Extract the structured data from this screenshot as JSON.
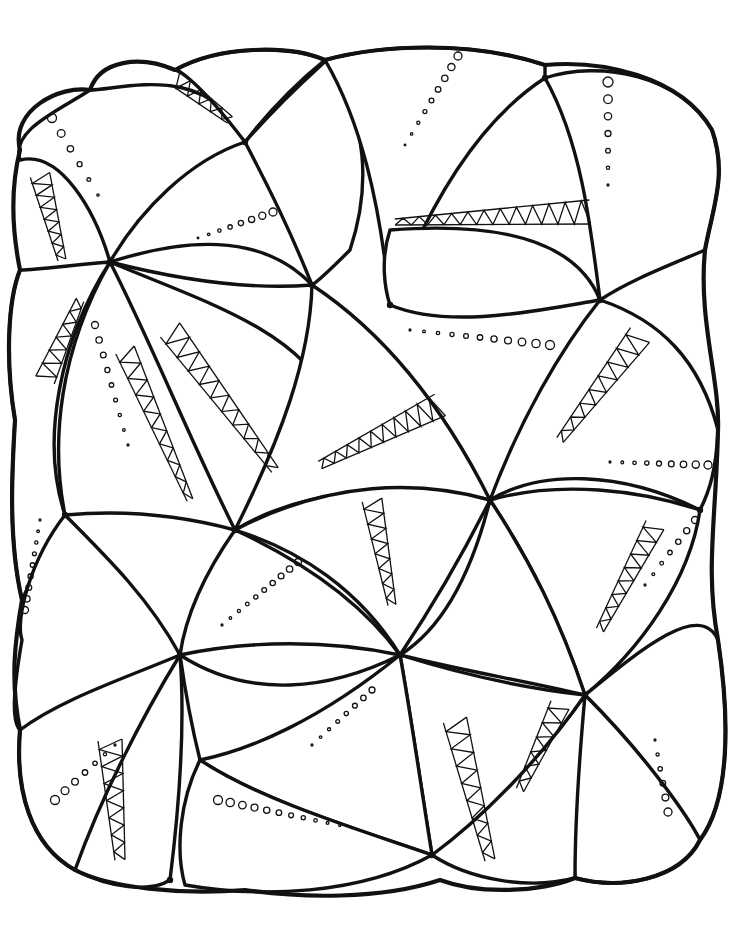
{
  "artwork": {
    "kind": "zentangle-coloring-page",
    "background": "#ffffff",
    "ink": "#111111",
    "outer_shape": "M 20 150 C 10 110 60 85 90 90 C 100 60 140 55 175 70 C 220 45 290 45 325 60 C 380 45 470 40 545 65 C 600 60 680 75 712 130 C 728 175 712 210 705 250 C 698 320 720 380 718 430 C 716 520 705 570 718 640 C 730 720 730 800 700 840 C 680 880 620 890 575 878 C 540 892 480 895 440 880 C 380 900 300 898 245 890 C 180 895 110 888 75 870 C 30 845 15 790 20 730 C 10 680 15 640 22 600 C 8 540 12 470 15 420 C 5 360 8 300 20 270 C 12 230 10 190 20 150 Z",
    "hubs": [
      {
        "x": 245,
        "y": 142
      },
      {
        "x": 110,
        "y": 262
      },
      {
        "x": 390,
        "y": 305
      },
      {
        "x": 545,
        "y": 78
      },
      {
        "x": 600,
        "y": 300
      },
      {
        "x": 312,
        "y": 285
      },
      {
        "x": 65,
        "y": 515
      },
      {
        "x": 235,
        "y": 530
      },
      {
        "x": 490,
        "y": 500
      },
      {
        "x": 180,
        "y": 655
      },
      {
        "x": 400,
        "y": 655
      },
      {
        "x": 585,
        "y": 695
      },
      {
        "x": 432,
        "y": 855
      },
      {
        "x": 170,
        "y": 880
      },
      {
        "x": 700,
        "y": 510
      }
    ],
    "petals": [
      {
        "d": "M 245 142 C 210 60 120 90 90 90 C 60 110 10 130 20 160 C 60 150 95 210 110 262 C 140 210 190 160 245 142 Z",
        "hub": 0,
        "rays": 16
      },
      {
        "d": "M 245 142 C 300 80 330 60 325 60 C 370 120 370 190 350 250 C 330 270 320 280 312 285 C 290 230 270 190 245 142 Z",
        "hub": 0,
        "rays": 14
      },
      {
        "d": "M 245 142 C 190 70 175 70 175 70 C 220 45 290 45 325 60 C 300 80 270 110 245 142 Z",
        "hub": 0,
        "rays": 12
      },
      {
        "d": "M 110 262 C 180 240 260 230 312 285 C 250 290 180 280 110 262 Z",
        "hub": 1,
        "rays": 12
      },
      {
        "d": "M 545 65 C 470 40 380 45 325 60 C 360 120 380 200 390 305 C 430 200 480 120 545 78 Z",
        "hub": 3,
        "rays": 18
      },
      {
        "d": "M 545 78 C 600 60 680 75 712 130 C 728 175 712 210 705 250 C 670 265 630 280 600 300 C 590 220 580 140 545 78 Z",
        "hub": 3,
        "rays": 14
      },
      {
        "d": "M 390 305 C 450 330 540 310 600 300 C 580 250 520 220 390 230 C 380 260 385 290 390 305 Z",
        "hub": 2,
        "rays": 14
      },
      {
        "d": "M 600 300 C 660 320 700 360 718 430 C 716 470 710 490 700 510 C 620 470 540 470 490 500 C 520 420 560 350 600 300 Z",
        "hub": 4,
        "rays": 18
      },
      {
        "d": "M 110 262 C 60 350 50 440 65 515 C 120 510 180 515 235 530 C 200 440 160 340 110 262 Z",
        "hub": 1,
        "rays": 18
      },
      {
        "d": "M 110 262 C 200 300 300 330 330 400 C 320 460 280 500 235 530 C 190 440 150 340 110 262 Z",
        "hub": 1,
        "rays": 16
      },
      {
        "d": "M 312 285 C 380 330 440 400 490 500 C 400 480 300 490 235 530 C 280 440 310 360 312 285 Z",
        "hub": 5,
        "rays": 18
      },
      {
        "d": "M 20 270 C 8 300 5 360 15 420 C 12 470 8 540 22 600 C 40 560 55 540 65 515 C 40 440 60 340 110 262 C 70 265 40 270 20 270 Z",
        "hub": 1,
        "rays": 12
      },
      {
        "d": "M 65 515 C 30 560 15 620 22 640 C 15 680 10 720 20 730 C 80 700 140 680 180 655 C 150 600 110 560 65 515 Z",
        "hub": 6,
        "rays": 16
      },
      {
        "d": "M 235 530 C 200 580 185 620 180 655 C 250 640 330 640 400 655 C 360 600 300 560 235 530 Z",
        "hub": 7,
        "rays": 16
      },
      {
        "d": "M 235 530 C 330 480 420 480 490 500 C 460 560 430 610 400 655 C 360 590 300 550 235 530 Z",
        "hub": 7,
        "rays": 18
      },
      {
        "d": "M 490 500 C 560 480 640 490 700 510 C 690 580 640 650 585 695 C 560 620 530 560 490 500 Z",
        "hub": 8,
        "rays": 18
      },
      {
        "d": "M 490 500 C 470 580 440 630 400 655 C 460 670 520 680 585 695 C 560 620 530 560 490 500 Z",
        "hub": 8,
        "rays": 14
      },
      {
        "d": "M 585 695 C 640 650 700 600 718 640 C 730 720 730 800 700 840 C 670 790 630 740 585 695 Z",
        "hub": 11,
        "rays": 16
      },
      {
        "d": "M 585 695 C 650 760 690 820 700 840 C 680 880 620 890 575 878 C 570 820 575 750 585 695 Z",
        "hub": 11,
        "rays": 14
      },
      {
        "d": "M 585 695 C 540 760 470 820 432 855 C 470 880 530 890 575 878 C 575 820 580 750 585 695 Z",
        "hub": 11,
        "rays": 14
      },
      {
        "d": "M 400 655 C 480 680 540 690 585 695 C 540 760 480 820 432 855 C 420 780 410 710 400 655 Z",
        "hub": 10,
        "rays": 16
      },
      {
        "d": "M 400 655 C 320 700 240 750 200 760 C 260 800 360 830 432 855 C 420 780 410 710 400 655 Z",
        "hub": 10,
        "rays": 16
      },
      {
        "d": "M 180 655 C 250 700 330 690 400 655 C 320 720 250 750 200 760 C 190 720 185 690 180 655 Z",
        "hub": 9,
        "rays": 12
      },
      {
        "d": "M 180 655 C 130 720 90 790 75 870 C 110 888 150 893 170 880 C 180 800 185 720 180 655 Z",
        "hub": 9,
        "rays": 12
      },
      {
        "d": "M 20 730 C 15 790 30 845 75 870 C 100 800 140 720 180 655 C 120 680 60 700 20 730 Z",
        "hub": 9,
        "rays": 14
      },
      {
        "d": "M 200 760 C 180 800 175 850 185 885 C 260 898 360 895 432 855 C 360 830 260 800 200 760 Z",
        "hub": 12,
        "rays": 16
      }
    ],
    "dot_rows": [
      {
        "x1": 52,
        "y1": 118,
        "x2": 98,
        "y2": 195,
        "count": 6,
        "r1": 4.5,
        "r2": 1.2
      },
      {
        "x1": 273,
        "y1": 212,
        "x2": 198,
        "y2": 238,
        "count": 8,
        "r1": 4,
        "r2": 0.8
      },
      {
        "x1": 458,
        "y1": 56,
        "x2": 405,
        "y2": 145,
        "count": 9,
        "r1": 4,
        "r2": 0.8
      },
      {
        "x1": 608,
        "y1": 82,
        "x2": 608,
        "y2": 185,
        "count": 7,
        "r1": 5,
        "r2": 1
      },
      {
        "x1": 550,
        "y1": 345,
        "x2": 410,
        "y2": 330,
        "count": 11,
        "r1": 4.5,
        "r2": 1
      },
      {
        "x1": 708,
        "y1": 465,
        "x2": 610,
        "y2": 462,
        "count": 9,
        "r1": 4,
        "r2": 1
      },
      {
        "x1": 95,
        "y1": 325,
        "x2": 128,
        "y2": 445,
        "count": 9,
        "r1": 3.5,
        "r2": 1
      },
      {
        "x1": 25,
        "y1": 610,
        "x2": 40,
        "y2": 520,
        "count": 9,
        "r1": 3.5,
        "r2": 1
      },
      {
        "x1": 298,
        "y1": 562,
        "x2": 222,
        "y2": 625,
        "count": 10,
        "r1": 3.5,
        "r2": 1
      },
      {
        "x1": 55,
        "y1": 800,
        "x2": 115,
        "y2": 745,
        "count": 7,
        "r1": 4.5,
        "r2": 1
      },
      {
        "x1": 218,
        "y1": 800,
        "x2": 352,
        "y2": 828,
        "count": 12,
        "r1": 4.5,
        "r2": 0.7
      },
      {
        "x1": 668,
        "y1": 812,
        "x2": 655,
        "y2": 740,
        "count": 6,
        "r1": 4,
        "r2": 1
      },
      {
        "x1": 372,
        "y1": 690,
        "x2": 312,
        "y2": 745,
        "count": 8,
        "r1": 3,
        "r2": 1
      },
      {
        "x1": 695,
        "y1": 520,
        "x2": 645,
        "y2": 585,
        "count": 7,
        "r1": 3.5,
        "r2": 1
      }
    ],
    "zigzag_bands": [
      {
        "x1": 40,
        "y1": 175,
        "x2": 62,
        "y2": 260,
        "teeth": 7,
        "w1": 10,
        "w2": 4
      },
      {
        "x1": 175,
        "y1": 78,
        "x2": 230,
        "y2": 120,
        "teeth": 5,
        "w1": 8,
        "w2": 4
      },
      {
        "x1": 590,
        "y1": 212,
        "x2": 395,
        "y2": 222,
        "teeth": 12,
        "w1": 12,
        "w2": 3
      },
      {
        "x1": 45,
        "y1": 380,
        "x2": 80,
        "y2": 300,
        "teeth": 6,
        "w1": 10,
        "w2": 4
      },
      {
        "x1": 170,
        "y1": 330,
        "x2": 275,
        "y2": 470,
        "teeth": 10,
        "w1": 12,
        "w2": 4
      },
      {
        "x1": 440,
        "y1": 405,
        "x2": 320,
        "y2": 465,
        "teeth": 10,
        "w1": 12,
        "w2": 4
      },
      {
        "x1": 640,
        "y1": 335,
        "x2": 560,
        "y2": 440,
        "teeth": 8,
        "w1": 12,
        "w2": 4
      },
      {
        "x1": 372,
        "y1": 500,
        "x2": 392,
        "y2": 605,
        "teeth": 7,
        "w1": 10,
        "w2": 4
      },
      {
        "x1": 655,
        "y1": 525,
        "x2": 600,
        "y2": 630,
        "teeth": 8,
        "w1": 10,
        "w2": 4
      },
      {
        "x1": 110,
        "y1": 740,
        "x2": 120,
        "y2": 860,
        "teeth": 7,
        "w1": 12,
        "w2": 5
      },
      {
        "x1": 455,
        "y1": 720,
        "x2": 490,
        "y2": 860,
        "teeth": 8,
        "w1": 12,
        "w2": 5
      },
      {
        "x1": 560,
        "y1": 705,
        "x2": 520,
        "y2": 790,
        "teeth": 6,
        "w1": 10,
        "w2": 4
      },
      {
        "x1": 125,
        "y1": 350,
        "x2": 190,
        "y2": 500,
        "teeth": 9,
        "w1": 10,
        "w2": 3
      }
    ]
  }
}
